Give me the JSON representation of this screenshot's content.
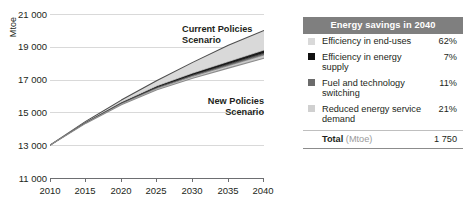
{
  "chart_data": {
    "type": "area",
    "title": "",
    "xlabel": "",
    "ylabel": "Mtoe",
    "x": [
      2010,
      2015,
      2020,
      2025,
      2030,
      2035,
      2040
    ],
    "xlim": [
      2010,
      2040
    ],
    "ylim": [
      11000,
      21000
    ],
    "yticks": [
      "11 000",
      "13 000",
      "15 000",
      "17 000",
      "19 000",
      "21 000"
    ],
    "ytick_values": [
      11000,
      13000,
      15000,
      17000,
      19000,
      21000
    ],
    "xticks": [
      "2010",
      "2015",
      "2020",
      "2025",
      "2030",
      "2035",
      "2040"
    ],
    "grid": true,
    "legend_position": "right",
    "annotations": [
      {
        "text": "Current Policies\nScenario",
        "x": 2030,
        "y": 20100
      },
      {
        "text": "New Policies\nScenario",
        "x": 2032,
        "y": 17300
      }
    ],
    "series": [
      {
        "name": "Current Policies Scenario",
        "role": "upper-boundary",
        "color": "#4d4d4d",
        "values": [
          13000,
          14450,
          15750,
          16950,
          18050,
          19100,
          20000
        ]
      },
      {
        "name": "Efficiency in end-uses (band top)",
        "role": "band-boundary",
        "color": "#d2d2d2",
        "values": [
          13000,
          14400,
          15620,
          16620,
          17400,
          18100,
          18800
        ]
      },
      {
        "name": "Efficiency in energy supply (band)",
        "role": "band-boundary",
        "color": "#1a1a1a",
        "values": [
          13000,
          14380,
          15570,
          16530,
          17280,
          17950,
          18620
        ]
      },
      {
        "name": "Fuel and technology switching (band)",
        "role": "band-boundary",
        "color": "#6e6e6e",
        "values": [
          13000,
          14360,
          15530,
          16470,
          17200,
          17850,
          18500
        ]
      },
      {
        "name": "New Policies Scenario",
        "role": "lower-boundary",
        "color": "#8c8c8c",
        "values": [
          13000,
          14330,
          15470,
          16380,
          17080,
          17700,
          18300
        ]
      }
    ]
  },
  "chart": {
    "yaxis_title": "Mtoe",
    "annotation_current": "Current Policies\nScenario",
    "annotation_new": "New Policies\nScenario"
  },
  "legend": {
    "header": "Energy savings in 2040",
    "rows": [
      {
        "label": "Efficiency in end-uses",
        "value": "62%",
        "color": "#d9d9d9"
      },
      {
        "label": "Efficiency in energy supply",
        "value": "7%",
        "color": "#111111"
      },
      {
        "label": "Fuel and technology switching",
        "value": "11%",
        "color": "#6b6b6b"
      },
      {
        "label": "Reduced energy service demand",
        "value": "21%",
        "color": "#d0d0d0"
      }
    ],
    "total_label": "Total",
    "total_unit": "(Mtoe)",
    "total_value": "1 750"
  }
}
